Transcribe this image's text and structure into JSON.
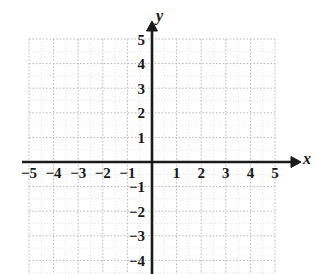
{
  "figure": {
    "kind": "cartesian-coordinate-plane",
    "background_color": "#ffffff",
    "width": 316,
    "height": 274
  },
  "chart_data": {
    "type": "scatter",
    "title": "",
    "subtitle": "",
    "xlabel": "x",
    "ylabel": "y",
    "xlim": [
      -5,
      5
    ],
    "ylim": [
      -5,
      5
    ],
    "x": [],
    "y": [],
    "series": [],
    "annotations": [],
    "grid": true,
    "grid_style": "dotted",
    "grid_color": "#bdbdbd",
    "minor_grid": true,
    "minor_grid_divisions": 1,
    "legend": false,
    "legend_position": "none",
    "axis_color": "#1a1a1a",
    "axis_arrows": [
      "x-positive",
      "y-positive"
    ],
    "xticks": [
      -5,
      -4,
      -3,
      -2,
      -1,
      1,
      2,
      3,
      4,
      5
    ],
    "yticks": [
      5,
      4,
      3,
      2,
      1,
      -1,
      -2,
      -3,
      -4
    ],
    "xtick_labels": [
      "−5",
      "−4",
      "−3",
      "−2",
      "−1",
      "1",
      "2",
      "3",
      "4",
      "5"
    ],
    "ytick_labels": [
      "5",
      "4",
      "3",
      "2",
      "1",
      "−1",
      "−2",
      "−3",
      "−4"
    ],
    "origin_label": "",
    "note": "Empty graphing grid; y axis label -5 is clipped by the bottom edge of the image."
  },
  "axes": {
    "x_axis_name": "x",
    "y_axis_name": "y",
    "origin_px": {
      "x": 152,
      "y": 162
    },
    "unit_px": 24.6
  },
  "labels": {
    "x": [
      {
        "value": -5,
        "text": "−5"
      },
      {
        "value": -4,
        "text": "−4"
      },
      {
        "value": -3,
        "text": "−3"
      },
      {
        "value": -2,
        "text": "−2"
      },
      {
        "value": -1,
        "text": "−1"
      },
      {
        "value": 1,
        "text": "1"
      },
      {
        "value": 2,
        "text": "2"
      },
      {
        "value": 3,
        "text": "3"
      },
      {
        "value": 4,
        "text": "4"
      },
      {
        "value": 5,
        "text": "5"
      }
    ],
    "y": [
      {
        "value": 5,
        "text": "5"
      },
      {
        "value": 4,
        "text": "4"
      },
      {
        "value": 3,
        "text": "3"
      },
      {
        "value": 2,
        "text": "2"
      },
      {
        "value": 1,
        "text": "1"
      },
      {
        "value": -1,
        "text": "−1"
      },
      {
        "value": -2,
        "text": "−2"
      },
      {
        "value": -3,
        "text": "−3"
      },
      {
        "value": -4,
        "text": "−4"
      }
    ]
  }
}
